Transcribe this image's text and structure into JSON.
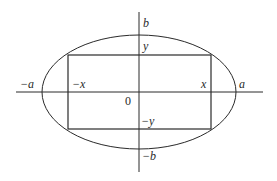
{
  "diagram": {
    "type": "ellipse-inscribed-rectangle",
    "stroke_color": "#2a2a2a",
    "axes": {
      "horizontal": {
        "x1": 16,
        "x2": 263,
        "y": 92
      },
      "vertical": {
        "x": 139,
        "y1": 12,
        "y2": 172
      }
    },
    "ellipse": {
      "cx": 139,
      "cy": 92,
      "rx": 97,
      "ry": 57
    },
    "rectangle": {
      "x1": 68,
      "y1": 55,
      "x2": 211,
      "y2": 129
    },
    "labels": {
      "neg_a": "−a",
      "pos_a": "a",
      "neg_x": "−x",
      "pos_x": "x",
      "pos_b": "b",
      "neg_b": "−b",
      "pos_y": "y",
      "neg_y": "−y",
      "origin": "0"
    }
  }
}
